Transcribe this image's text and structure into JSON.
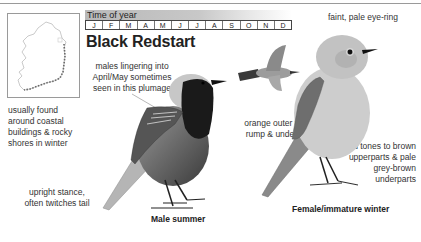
{
  "page": {
    "species_title": "Black Redstart",
    "time_of_year": {
      "label": "Time of year",
      "months": [
        "J",
        "F",
        "M",
        "A",
        "M",
        "J",
        "J",
        "A",
        "S",
        "O",
        "N",
        "D"
      ]
    },
    "map": {
      "icon": "ireland-distribution-map-icon"
    },
    "annotations": {
      "habitat": [
        "usually found",
        "around coastal",
        "buildings & rocky",
        "shores in winter"
      ],
      "behaviour": [
        "upright stance,",
        "often twitches tail"
      ],
      "male_plumage": [
        "males lingering into",
        "April/May sometimes",
        "seen in this plumage"
      ],
      "tail": [
        "orange outer tail,",
        "rump & undertail"
      ],
      "eye_ring": "faint, pale eye-ring",
      "female_colour": [
        "cold tones to brown",
        "upperparts & pale",
        "grey-brown",
        "underparts"
      ]
    },
    "captions": {
      "male": "Male summer",
      "female": "Female/immature winter"
    },
    "colors": {
      "rule": "#9a9a9a",
      "text": "#2a2a2a"
    }
  }
}
